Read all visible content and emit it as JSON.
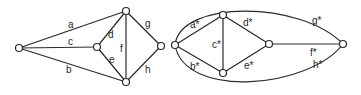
{
  "diagram": {
    "colors": {
      "stroke": "#2a2a2a",
      "background": "#ffffff",
      "vertex_fill": "#ffffff"
    },
    "graph_primal": {
      "vertices": [
        {
          "id": "L",
          "x": 19,
          "y": 48
        },
        {
          "id": "M",
          "x": 97,
          "y": 47
        },
        {
          "id": "T",
          "x": 126,
          "y": 11
        },
        {
          "id": "B",
          "x": 126,
          "y": 82
        },
        {
          "id": "R",
          "x": 161,
          "y": 46
        }
      ],
      "edges": [
        {
          "label": "a",
          "from": "L",
          "to": "T"
        },
        {
          "label": "b",
          "from": "L",
          "to": "B"
        },
        {
          "label": "c",
          "from": "L",
          "to": "M"
        },
        {
          "label": "d",
          "from": "M",
          "to": "T"
        },
        {
          "label": "e",
          "from": "M",
          "to": "B"
        },
        {
          "label": "f",
          "from": "T",
          "to": "B"
        },
        {
          "label": "g",
          "from": "T",
          "to": "R"
        },
        {
          "label": "h",
          "from": "B",
          "to": "R"
        }
      ]
    },
    "graph_dual": {
      "vertices": [
        {
          "id": "L*",
          "x": 175,
          "y": 45
        },
        {
          "id": "T*",
          "x": 223,
          "y": 15
        },
        {
          "id": "B*",
          "x": 223,
          "y": 73
        },
        {
          "id": "M*",
          "x": 269,
          "y": 44
        },
        {
          "id": "R*",
          "x": 343,
          "y": 44
        }
      ],
      "edges": [
        {
          "label": "a*",
          "from": "L*",
          "to": "T*"
        },
        {
          "label": "b*",
          "from": "L*",
          "to": "B*"
        },
        {
          "label": "c*",
          "from": "T*",
          "to": "B*"
        },
        {
          "label": "d*",
          "from": "T*",
          "to": "M*"
        },
        {
          "label": "e*",
          "from": "B*",
          "to": "M*"
        },
        {
          "label": "f*",
          "from": "M*",
          "to": "R*"
        },
        {
          "label": "g*",
          "from": "L*",
          "to": "R*",
          "curve": "top"
        },
        {
          "label": "h*",
          "from": "L*",
          "to": "R*",
          "curve": "bottom"
        }
      ]
    },
    "labels": {
      "a": "a",
      "b": "b",
      "c": "c",
      "d": "d",
      "e": "e",
      "f": "f",
      "g": "g",
      "h": "h",
      "a_star": "a*",
      "b_star": "b*",
      "c_star": "c*",
      "d_star": "d*",
      "e_star": "e*",
      "f_star": "f*",
      "g_star": "g*",
      "h_star": "h*"
    }
  }
}
